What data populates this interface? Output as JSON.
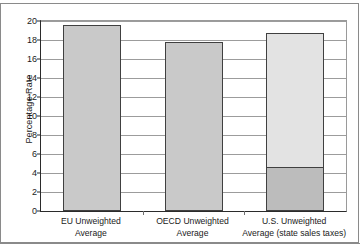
{
  "chart_data": {
    "type": "bar",
    "title": "",
    "xlabel": "",
    "ylabel": "Percentage Rate",
    "ylim": [
      0,
      20
    ],
    "yticks": [
      0,
      2,
      4,
      6,
      8,
      10,
      12,
      14,
      16,
      18,
      20
    ],
    "ytick_labels": [
      "0",
      "2",
      "4",
      "6",
      "8",
      "10",
      "12",
      "14",
      "16",
      "18",
      "20"
    ],
    "grid": true,
    "legend": "none",
    "categories": [
      "EU Unweighted Average",
      "OECD Unweighted Average",
      "U.S. Unweighted Average (state sales taxes)"
    ],
    "category_lines": [
      [
        "EU Unweighted",
        "Average"
      ],
      [
        "OECD Unweighted",
        "Average"
      ],
      [
        "U.S. Unweighted",
        "Average (state sales taxes)"
      ]
    ],
    "values": [
      19.6,
      17.8,
      18.7
    ],
    "bars": [
      {
        "category": "EU Unweighted Average",
        "total": 19.6,
        "segments": [
          {
            "name": "value-added tax rate",
            "from": 0,
            "to": 19.6,
            "color": "#c9c9c9"
          }
        ]
      },
      {
        "category": "OECD Unweighted Average",
        "total": 17.8,
        "segments": [
          {
            "name": "value-added tax rate",
            "from": 0,
            "to": 17.8,
            "color": "#c9c9c9"
          }
        ]
      },
      {
        "category": "U.S. Unweighted Average (state sales taxes)",
        "total": 18.7,
        "segments": [
          {
            "name": "upper segment",
            "from": 4.6,
            "to": 18.7,
            "color": "#e3e3e3"
          },
          {
            "name": "state sales taxes",
            "from": 0,
            "to": 4.6,
            "color": "#bcbcbc"
          }
        ]
      }
    ],
    "colors": {
      "bar_fill": "#c9c9c9",
      "bar_fill_light": "#e3e3e3",
      "bar_fill_dark": "#bcbcbc",
      "bar_border": "#404040",
      "gridline": "#9c9c9c",
      "axis": "#2b2b2b",
      "background": "#ffffff"
    }
  }
}
